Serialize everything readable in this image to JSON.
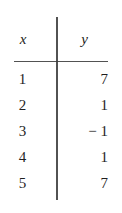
{
  "figure": {
    "type": "value-table",
    "background_color": "#ffffff",
    "ink_color": "#1f1f1f",
    "rule_color": "#3a3a3a"
  },
  "table": {
    "headers": {
      "x": "x",
      "y": "y"
    },
    "rows": [
      {
        "x": "1",
        "y": "7"
      },
      {
        "x": "2",
        "y": "1"
      },
      {
        "x": "3",
        "y": "− 1"
      },
      {
        "x": "4",
        "y": "1"
      },
      {
        "x": "5",
        "y": "7"
      }
    ]
  },
  "chart_data": {
    "type": "table",
    "title": "",
    "xlabel": "x",
    "ylabel": "y",
    "categories": [
      "1",
      "2",
      "3",
      "4",
      "5"
    ],
    "x": [
      1,
      2,
      3,
      4,
      5
    ],
    "values": [
      7,
      1,
      -1,
      1,
      7
    ],
    "series": [
      {
        "name": "y",
        "values": [
          7,
          1,
          -1,
          1,
          7
        ]
      }
    ],
    "grid": false,
    "legend": "none"
  }
}
